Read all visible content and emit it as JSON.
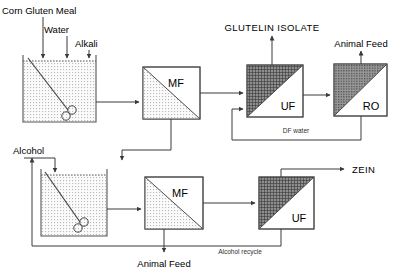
{
  "diagram": {
    "type": "process-flow-diagram"
  },
  "inputs": {
    "corn_gluten_meal": "Corn Gluten Meal",
    "water": "Water",
    "alkali": "Alkali",
    "alcohol": "Alcohol"
  },
  "products": {
    "glutelin_isolate": "GLUTELIN  ISOLATE",
    "animal_feed_top": "Animal Feed",
    "animal_feed_bottom": "Animal Feed",
    "zein": "ZEIN"
  },
  "streams": {
    "df_water": "DF water",
    "alcohol_recycle": "Alcohol recycle"
  },
  "units": {
    "mf_top": "MF",
    "uf_top": "UF",
    "ro": "RO",
    "mf_bottom": "MF",
    "uf_bottom": "UF"
  },
  "vessels": {
    "extraction_tank": "extraction-tank",
    "alcohol_tank": "alcohol-extraction-tank"
  },
  "colors": {
    "line": "#3a3a3a",
    "fill_light": "#e9e9e9",
    "fill_dark": "#6f6f6f",
    "background": "#ffffff",
    "text": "#000000"
  }
}
